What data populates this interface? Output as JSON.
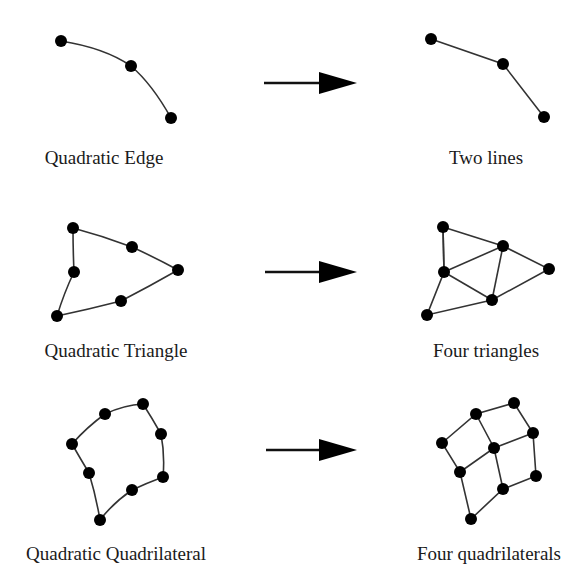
{
  "diagram": {
    "rows": [
      {
        "source_label": "Quadratic Edge",
        "target_label": "Two lines",
        "source_label_pos": [
          104,
          160
        ],
        "target_label_pos": [
          486,
          160
        ],
        "arrow": {
          "x1": 264,
          "x2": 357,
          "y": 83
        }
      },
      {
        "source_label": "Quadratic Triangle",
        "target_label": "Four triangles",
        "source_label_pos": [
          116,
          352
        ],
        "target_label_pos": [
          486,
          352
        ],
        "arrow": {
          "x1": 265,
          "x2": 357,
          "y": 272
        }
      },
      {
        "source_label": "Quadratic Quadrilateral",
        "target_label": "Four quadrilaterals",
        "source_label_pos": [
          116,
          556
        ],
        "target_label_pos": [
          489,
          556
        ],
        "arrow": {
          "x1": 266,
          "x2": 357,
          "y": 450
        }
      }
    ]
  }
}
